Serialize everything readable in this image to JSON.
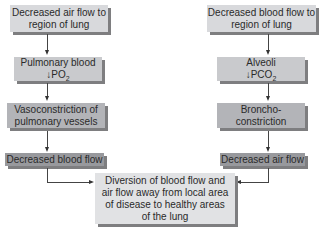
{
  "left": {
    "box1": [
      "Decreased air flow to",
      "region of lung"
    ],
    "box2": {
      "line1": "Pulmonary blood",
      "prefix": "↓PO",
      "sub": "2"
    },
    "box3": [
      "Vasoconstriction of",
      "pulmonary vessels"
    ],
    "box4": "Decreased blood flow"
  },
  "right": {
    "box1": [
      "Decreased blood flow to",
      "region of lung"
    ],
    "box2": {
      "line1": "Alveoli",
      "prefix": "↓PCO",
      "sub": "2"
    },
    "box3": [
      "Broncho-",
      "constriction"
    ],
    "box4": "Decreased air flow"
  },
  "result": [
    "Diversion of blood flow and",
    "air flow away from local area",
    "of disease to healthy areas",
    "of the lung"
  ]
}
